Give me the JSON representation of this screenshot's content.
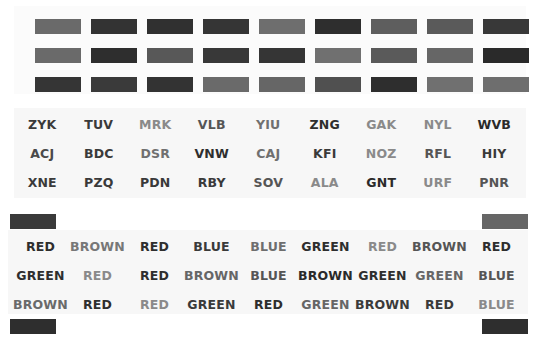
{
  "swatches": {
    "rows": [
      [
        "#6a6a6a",
        "#333333",
        "#303030",
        "#353535",
        "#6e6e6e",
        "#2e2e2e",
        "#5e5e5e",
        "#5a5a5a",
        "#383838"
      ],
      [
        "#6a6a6a",
        "#2e2e2e",
        "#585858",
        "#383838",
        "#353535",
        "#707070",
        "#5a5a5a",
        "#666666",
        "#2a2a2a"
      ],
      [
        "#353535",
        "#3a3a3a",
        "#333333",
        "#6a6a6a",
        "#666666",
        "#505050",
        "#2e2e2e",
        "#707070",
        "#6e6e6e"
      ]
    ]
  },
  "letter_strings": {
    "rows": [
      [
        {
          "text": "ZYK",
          "color": "#3a3a3a"
        },
        {
          "text": "TUV",
          "color": "#3a3a3a"
        },
        {
          "text": "MRK",
          "color": "#8a8a8a"
        },
        {
          "text": "VLB",
          "color": "#555555"
        },
        {
          "text": "YIU",
          "color": "#707070"
        },
        {
          "text": "ZNG",
          "color": "#2e2e2e"
        },
        {
          "text": "GAK",
          "color": "#8a8a8a"
        },
        {
          "text": "NYL",
          "color": "#8a8a8a"
        },
        {
          "text": "WVB",
          "color": "#2a2a2a"
        }
      ],
      [
        {
          "text": "ACJ",
          "color": "#4a4a4a"
        },
        {
          "text": "BDC",
          "color": "#3a3a3a"
        },
        {
          "text": "DSR",
          "color": "#707070"
        },
        {
          "text": "VNW",
          "color": "#2e2e2e"
        },
        {
          "text": "CAJ",
          "color": "#707070"
        },
        {
          "text": "KFI",
          "color": "#3a3a3a"
        },
        {
          "text": "NOZ",
          "color": "#8a8a8a"
        },
        {
          "text": "RFL",
          "color": "#555555"
        },
        {
          "text": "HIY",
          "color": "#3a3a3a"
        }
      ],
      [
        {
          "text": "XNE",
          "color": "#3a3a3a"
        },
        {
          "text": "PZQ",
          "color": "#3a3a3a"
        },
        {
          "text": "PDN",
          "color": "#3a3a3a"
        },
        {
          "text": "RBY",
          "color": "#3a3a3a"
        },
        {
          "text": "SOV",
          "color": "#555555"
        },
        {
          "text": "ALA",
          "color": "#8a8a8a"
        },
        {
          "text": "GNT",
          "color": "#2a2a2a"
        },
        {
          "text": "URF",
          "color": "#8a8a8a"
        },
        {
          "text": "PNR",
          "color": "#555555"
        }
      ]
    ]
  },
  "color_words": {
    "rows": [
      [
        {
          "text": "RED",
          "color": "#2e2e2e"
        },
        {
          "text": "BROWN",
          "color": "#777777"
        },
        {
          "text": "RED",
          "color": "#2e2e2e"
        },
        {
          "text": "BLUE",
          "color": "#3a3a3a"
        },
        {
          "text": "BLUE",
          "color": "#6e6e6e"
        },
        {
          "text": "GREEN",
          "color": "#2e2e2e"
        },
        {
          "text": "RED",
          "color": "#8a8a8a"
        },
        {
          "text": "BROWN",
          "color": "#555555"
        },
        {
          "text": "RED",
          "color": "#2e2e2e"
        }
      ],
      [
        {
          "text": "GREEN",
          "color": "#2e2e2e"
        },
        {
          "text": "RED",
          "color": "#8a8a8a"
        },
        {
          "text": "RED",
          "color": "#2e2e2e"
        },
        {
          "text": "BROWN",
          "color": "#666666"
        },
        {
          "text": "BLUE",
          "color": "#555555"
        },
        {
          "text": "BROWN",
          "color": "#2a2a2a"
        },
        {
          "text": "GREEN",
          "color": "#2e2e2e"
        },
        {
          "text": "GREEN",
          "color": "#666666"
        },
        {
          "text": "BLUE",
          "color": "#555555"
        }
      ],
      [
        {
          "text": "BROWN",
          "color": "#6a6a6a"
        },
        {
          "text": "RED",
          "color": "#2e2e2e"
        },
        {
          "text": "RED",
          "color": "#8a8a8a"
        },
        {
          "text": "GREEN",
          "color": "#3a3a3a"
        },
        {
          "text": "RED",
          "color": "#2e2e2e"
        },
        {
          "text": "GREEN",
          "color": "#666666"
        },
        {
          "text": "BROWN",
          "color": "#3a3a3a"
        },
        {
          "text": "RED",
          "color": "#3a3a3a"
        },
        {
          "text": "BLUE",
          "color": "#8a8a8a"
        }
      ]
    ]
  },
  "edge_markers": [
    {
      "position": "top-left",
      "color": "#3a3a3a"
    },
    {
      "position": "top-right",
      "color": "#666666"
    },
    {
      "position": "bottom-left",
      "color": "#2e2e2e"
    },
    {
      "position": "bottom-right",
      "color": "#2e2e2e"
    }
  ]
}
